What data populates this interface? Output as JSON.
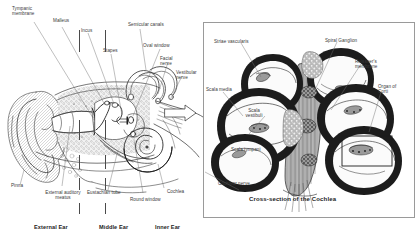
{
  "figure": {
    "type": "anatomical-diagram",
    "background_color": "#ffffff",
    "ink_color": "#2b2b2b",
    "panel_border_color": "#9a9a9a"
  },
  "left_panel": {
    "name": "ear-anatomy-illustration",
    "labels": [
      {
        "id": "tympanic-membrane",
        "text": "Tympanic\nmembrane"
      },
      {
        "id": "malleus",
        "text": "Malleus"
      },
      {
        "id": "incus",
        "text": "Incus"
      },
      {
        "id": "stapes",
        "text": "Stapes"
      },
      {
        "id": "semicircular-canals",
        "text": "Semicular canals"
      },
      {
        "id": "oval-window",
        "text": "Oval window"
      },
      {
        "id": "facial-nerve",
        "text": "Facial\nnerve"
      },
      {
        "id": "vestibular-nerve",
        "text": "Vestibular\nnerve"
      },
      {
        "id": "pinna",
        "text": "Pinna"
      },
      {
        "id": "external-auditory-meatus",
        "text": "External auditory\nmeatus"
      },
      {
        "id": "eustachian-tube",
        "text": "Eustachian tube"
      },
      {
        "id": "round-window",
        "text": "Round window"
      },
      {
        "id": "cochlea",
        "text": "Cochlea"
      }
    ],
    "sections": [
      {
        "id": "external-ear",
        "text": "External Ear"
      },
      {
        "id": "middle-ear",
        "text": "Middle Ear"
      },
      {
        "id": "inner-ear",
        "text": "Inner Ear"
      }
    ]
  },
  "right_panel": {
    "name": "cochlea-cross-section-panel",
    "caption": "Cross-section of the Cochlea",
    "labels": [
      {
        "id": "striae-vascularis",
        "text": "Striae vascularis"
      },
      {
        "id": "spiral-ganglion",
        "text": "Spiral Ganglion"
      },
      {
        "id": "reissners-membrane",
        "text": "Reissner's\nmembrane"
      },
      {
        "id": "organ-of-corti",
        "text": "Organ of\nCorti"
      },
      {
        "id": "scala-media",
        "text": "Scala media"
      },
      {
        "id": "scala-vestibuli",
        "text": "Scala\nvestibuli"
      },
      {
        "id": "scala-tympani",
        "text": "Scala tympani"
      },
      {
        "id": "cochlear-nerve",
        "text": "Cochlear nerve"
      }
    ]
  }
}
